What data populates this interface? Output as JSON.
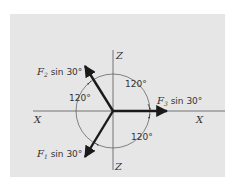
{
  "figure": {
    "axes": {
      "x_left_label": "X",
      "x_right_label": "X",
      "z_top_label": "Z",
      "z_bottom_label": "Z"
    },
    "forces": [
      {
        "symbol": "F",
        "subscript": "1",
        "suffix": " sin 30°",
        "direction_deg": 240
      },
      {
        "symbol": "F",
        "subscript": "2",
        "suffix": " sin 30°",
        "direction_deg": 120
      },
      {
        "symbol": "F",
        "subscript": "3",
        "suffix": " sin 30°",
        "direction_deg": 0
      }
    ],
    "angles": [
      {
        "label": "120°",
        "position": "upper-right"
      },
      {
        "label": "120°",
        "position": "left"
      },
      {
        "label": "120°",
        "position": "lower-right"
      }
    ],
    "colors": {
      "background": "#e6e6e6",
      "ink": "#1a1a1a"
    }
  }
}
